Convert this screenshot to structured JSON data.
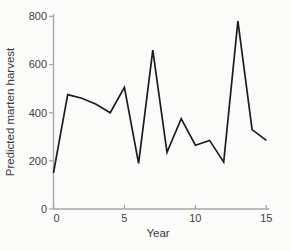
{
  "chart_data": {
    "type": "line",
    "title": "",
    "xlabel": "Year",
    "ylabel": "Predicted marten harvest",
    "x": [
      0,
      1,
      2,
      3,
      4,
      5,
      6,
      7,
      8,
      9,
      10,
      11,
      12,
      13,
      14,
      15
    ],
    "values": [
      150,
      475,
      460,
      435,
      400,
      505,
      190,
      660,
      235,
      375,
      265,
      285,
      195,
      780,
      330,
      285
    ],
    "xlim": [
      0,
      15
    ],
    "ylim": [
      0,
      800
    ],
    "xticks": [
      0,
      5,
      10,
      15
    ],
    "yticks": [
      0,
      200,
      400,
      600,
      800
    ],
    "grid": false,
    "legend": false,
    "line_color": "#1c1c1c",
    "axis_color": "#a8a8a8",
    "tick_label_color": "#3f3f3f",
    "background_color": "#fbfbfa"
  }
}
